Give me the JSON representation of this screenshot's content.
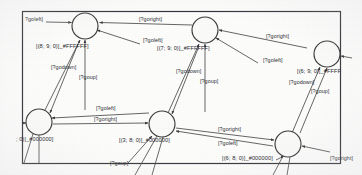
{
  "diagram": {
    "kind": "state-transition-diagram",
    "frame": {
      "visible": true,
      "stroke": "#35353a"
    },
    "background_color": "#fdfdfc",
    "node_fill": "#fbfbfa",
    "node_stroke": "#3a3a3a",
    "edge_stroke": "#4a4a4a",
    "text_color": "#2e2e33",
    "states": [
      {
        "id": "s-top-left",
        "label": "[(8; 9; 0)]_#FFFFFF]",
        "color_code": "#FFFFFF",
        "coords": "(8; 9; 0)",
        "cx": 85,
        "cy": 26,
        "r": 13
      },
      {
        "id": "s-top-middle",
        "label": "[(7; 9; 0)]_#FFFFFF]",
        "color_code": "#FFFFFF",
        "coords": "(7; 9; 0)",
        "cx": 205,
        "cy": 30,
        "r": 13
      },
      {
        "id": "s-top-right",
        "label": "[(6; 9; 0)]_#FFFF",
        "color_code": "#FFFF",
        "coords": "(6; 9; 0)",
        "cx": 327,
        "cy": 54,
        "r": 13
      },
      {
        "id": "s-bottom-left",
        "label": "; 0)]_#000000]",
        "color_code": "#000000",
        "coords": "; 0)",
        "cx": 39,
        "cy": 122,
        "r": 13
      },
      {
        "id": "s-bottom-middle",
        "label": "[(3; 8; 0)]_#000000]",
        "color_code": "#000000",
        "coords": "(3; 8; 0)",
        "cx": 162,
        "cy": 124,
        "r": 13
      },
      {
        "id": "s-bottom-right",
        "label": "[(6; 8; 0)]_#000000]",
        "color_code": "#000000",
        "coords": "(6; 8; 0)",
        "cx": 288,
        "cy": 144,
        "r": 13
      }
    ],
    "transition_labels": [
      {
        "id": "t1",
        "text": "?goleft]",
        "x": 25,
        "y": 21
      },
      {
        "id": "t2",
        "text": "[?goright]",
        "x": 139,
        "y": 21
      },
      {
        "id": "t3",
        "text": "[?goleft]",
        "x": 143,
        "y": 42
      },
      {
        "id": "t4",
        "text": "[?goright]",
        "x": 266,
        "y": 38
      },
      {
        "id": "t5",
        "text": "[?goleft]",
        "x": 263,
        "y": 62
      },
      {
        "id": "t6",
        "text": "[?godown]",
        "x": 51,
        "y": 69
      },
      {
        "id": "t7",
        "text": "[?goup]",
        "x": 79,
        "y": 79
      },
      {
        "id": "t8",
        "text": "[?godown]",
        "x": 176,
        "y": 73
      },
      {
        "id": "t9",
        "text": "[?goup]",
        "x": 200,
        "y": 83
      },
      {
        "id": "t10",
        "text": "[?godown]",
        "x": 289,
        "y": 84
      },
      {
        "id": "t11",
        "text": "[?goup]",
        "x": 311,
        "y": 93
      },
      {
        "id": "t12",
        "text": "[?goleft]",
        "x": 96,
        "y": 110
      },
      {
        "id": "t13",
        "text": "[?goright]",
        "x": 94,
        "y": 121
      },
      {
        "id": "t14",
        "text": "[?goright]",
        "x": 218,
        "y": 131
      },
      {
        "id": "t15",
        "text": "[?goleft]",
        "x": 218,
        "y": 145
      },
      {
        "id": "t16",
        "text": "[?goup]",
        "x": 110,
        "y": 165
      },
      {
        "id": "t17",
        "text": "[?goright]",
        "x": 330,
        "y": 160
      }
    ]
  }
}
